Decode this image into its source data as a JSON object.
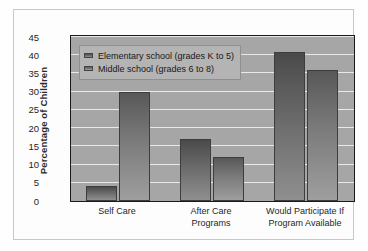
{
  "chart_data": {
    "type": "bar",
    "title": "",
    "xlabel": "",
    "ylabel": "Percentage of Children",
    "ylim": [
      0,
      45
    ],
    "ytick_labels": [
      "0",
      "5",
      "10",
      "15",
      "20",
      "25",
      "30",
      "35",
      "40",
      "45"
    ],
    "ytick_values": [
      0,
      5,
      10,
      15,
      20,
      25,
      30,
      35,
      40,
      45
    ],
    "grid": true,
    "legend_position": "upper left",
    "categories": [
      [
        "Self Care"
      ],
      [
        "After Care",
        "Programs"
      ],
      [
        "Would Participate If",
        "Program Available"
      ]
    ],
    "series": [
      {
        "name": "Elementary school (grades K to 5)",
        "values": [
          4,
          17,
          41
        ]
      },
      {
        "name": "Middle school (grades 6 to 8)",
        "values": [
          30,
          12,
          36
        ]
      }
    ]
  }
}
